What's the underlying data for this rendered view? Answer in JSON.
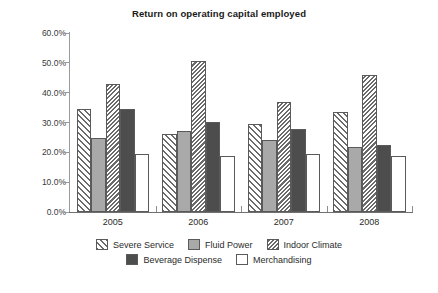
{
  "chart_data": {
    "type": "bar",
    "title": "Return on operating capital employed",
    "xlabel": "",
    "ylabel": "",
    "categories": [
      "2005",
      "2006",
      "2007",
      "2008"
    ],
    "series": [
      {
        "name": "Severe Service",
        "pattern": "diagonal-hatch-wide",
        "color": "#ffffff",
        "values": [
          34.5,
          26.0,
          29.5,
          33.5
        ]
      },
      {
        "name": "Fluid Power",
        "pattern": "solid",
        "color": "#a9a9a9",
        "values": [
          24.8,
          27.2,
          24.3,
          21.8
        ]
      },
      {
        "name": "Indoor Climate",
        "pattern": "diagonal-hatch-dense",
        "color": "#ffffff",
        "values": [
          42.8,
          50.5,
          37.0,
          46.0
        ]
      },
      {
        "name": "Beverage Dispense",
        "pattern": "solid",
        "color": "#4d4d4d",
        "values": [
          34.5,
          30.2,
          27.8,
          22.5
        ]
      },
      {
        "name": "Merchandising",
        "pattern": "none",
        "color": "#ffffff",
        "values": [
          19.5,
          18.8,
          19.4,
          18.8
        ]
      }
    ],
    "ylim": [
      0,
      60
    ],
    "ytick_values": [
      60,
      50,
      40,
      30,
      20,
      10,
      0
    ],
    "ytick_labels": [
      "60.0%",
      "50.0%",
      "40.0%",
      "30.0%",
      "20.0%",
      "10.0%",
      "0.0%"
    ],
    "grid": false,
    "legend_position": "bottom"
  }
}
